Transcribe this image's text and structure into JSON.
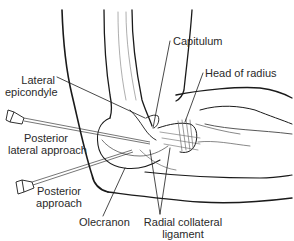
{
  "figure": {
    "line_color": "#1a1a1a",
    "background": "#ffffff"
  },
  "labels": {
    "capitulum": "Capitulum",
    "lateral_epicondyle_1": "Lateral",
    "lateral_epicondyle_2": "epicondyle",
    "head_of_radius": "Head of radius",
    "posterior_lateral_1": "Posterior",
    "posterior_lateral_2": "lateral approach",
    "posterior_1": "Posterior",
    "posterior_2": "approach",
    "olecranon": "Olecranon",
    "radial_collateral_1": "Radial collateral",
    "radial_collateral_2": "ligament"
  }
}
